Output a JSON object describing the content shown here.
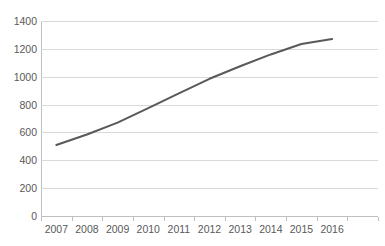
{
  "chart_data": {
    "type": "line",
    "title": "",
    "subtitle": "",
    "xlabel": "",
    "ylabel": "",
    "categories": [
      "2007",
      "2008",
      "2009",
      "2010",
      "2011",
      "2012",
      "2013",
      "2014",
      "2015",
      "2016"
    ],
    "series": [
      {
        "name": "Series 1",
        "color": "#595959",
        "values": [
          510,
          585,
          670,
          775,
          880,
          985,
          1075,
          1160,
          1235,
          1270
        ]
      }
    ],
    "ylim": [
      0,
      1400
    ],
    "yticks": [
      0,
      200,
      400,
      600,
      800,
      1000,
      1200,
      1400
    ],
    "ytick_labels": [
      "0",
      "200",
      "400",
      "600",
      "800",
      "1000",
      "1200",
      "1400"
    ],
    "grid": true,
    "grid_axis": "y",
    "legend": false,
    "legend_position": "none",
    "markers": false,
    "trailing_empty_category": true,
    "annotations": []
  },
  "style": {
    "line_color": "#595959",
    "gridline_color": "#d9d9d9",
    "axis_color": "#bfbfbf",
    "tick_label_color": "#595959",
    "background": "#ffffff"
  }
}
